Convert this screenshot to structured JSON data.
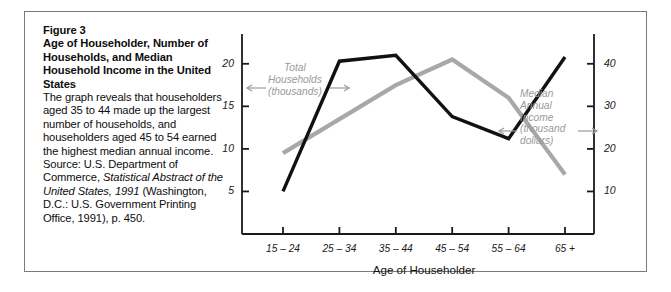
{
  "figure": {
    "label": "Figure 3",
    "title": "Age of Householder, Number of Households, and Median Household Income in the United States",
    "caption_part1": "The graph reveals that householders aged 35 to 44 made up the largest number of households, and householders aged 45 to 54 earned the highest median annual income. Source: U.S. Department of Commerce, ",
    "caption_italic1": "Statistical Abstract of the United States, 1991",
    "caption_part2": " (Washington, D.C.: U.S. Government Printing Office, 1991), p. 450.",
    "colors": {
      "series_black": "#111111",
      "series_gray": "#a8a8a8",
      "axis": "#1a1a1a",
      "frame": "#7a7a7a",
      "annotation_text": "#9a9a9a"
    }
  },
  "chart_data": {
    "type": "line",
    "title": "",
    "xlabel": "Age of Householder",
    "categories": [
      "15 – 24",
      "25 – 34",
      "35 – 44",
      "45 – 54",
      "55 – 64",
      "65 +"
    ],
    "grid": false,
    "legend_position": "inline-annotation",
    "axes": {
      "left": {
        "label": "Total Households (thousands)",
        "ticks": [
          5,
          10,
          15,
          20
        ],
        "tick_labels": [
          "5",
          "10",
          "15",
          "20"
        ],
        "ylim": [
          0,
          23.5
        ]
      },
      "right": {
        "label": "Median Annual Income (thousand dollars)",
        "ticks": [
          10,
          20,
          30,
          40
        ],
        "tick_labels": [
          "10",
          "20",
          "30",
          "40"
        ],
        "ylim": [
          0,
          47
        ]
      }
    },
    "series": [
      {
        "name": "Total Households (thousands)",
        "axis": "left",
        "color": "#111111",
        "values": [
          5.0,
          20.3,
          21.0,
          13.8,
          11.2,
          20.8
        ]
      },
      {
        "name": "Median Annual Income (thousand dollars)",
        "axis": "right",
        "color": "#a8a8a8",
        "values": [
          19.0,
          27.0,
          35.0,
          41.0,
          32.0,
          14.0
        ]
      }
    ],
    "annotations": [
      {
        "name": "total-households-annotation",
        "lines": [
          "Total",
          "Households",
          "(thousands)"
        ],
        "color": "#9a9a9a",
        "points_to": "left-axis-and-black-line"
      },
      {
        "name": "median-income-annotation",
        "lines": [
          "Median",
          "Annual",
          "Income",
          "(thousand",
          "dollars)"
        ],
        "color": "#9a9a9a",
        "points_to": "right-axis-and-gray-line"
      }
    ]
  }
}
